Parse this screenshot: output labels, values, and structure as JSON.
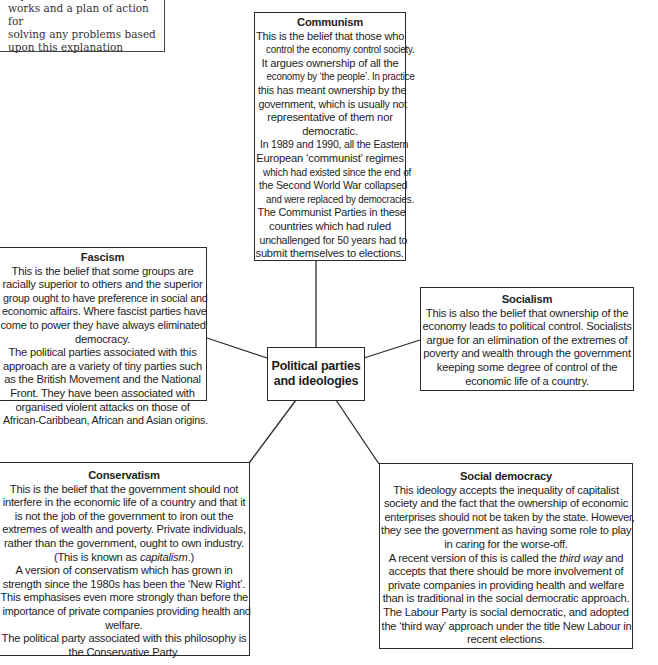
{
  "diagram": {
    "center": {
      "line1": "Political parties",
      "line2": "and ideologies"
    },
    "partial_box": {
      "lines": [
        "explanation of how society",
        "works and a plan of action for",
        "solving any problems based",
        "upon this explanation"
      ]
    },
    "communism": {
      "title": "Communism",
      "lines": [
        "This is the belief that those who",
        "control the economy control society.",
        "It argues ownership of all the",
        "economy by ‘the people’. In practice",
        "this has meant ownership by the",
        "government, which is usually not",
        "representative of them nor",
        "democratic.",
        "In 1989 and 1990, all the Eastern",
        "European ‘communist’ regimes",
        "which had existed since the end of",
        "the Second World War collapsed",
        "and were replaced by democracies.",
        "The Communist Parties in these",
        "countries which had ruled",
        "unchallenged for 50 years had to",
        "submit themselves to elections."
      ]
    },
    "fascism": {
      "title": "Fascism",
      "lines": [
        "This is the belief that some groups are",
        "racially superior to others and the superior",
        "group ought to have preference in social and",
        "economic affairs. Where fascist parties have",
        "come to power they have always eliminated",
        "democracy.",
        "The political parties associated with this",
        "approach are a variety of tiny parties such",
        "as the British Movement and the National",
        "Front. They have been associated with",
        "organised violent attacks on those of",
        "African-Caribbean, African and Asian origins."
      ]
    },
    "socialism": {
      "title": "Socialism",
      "lines": [
        "This is also the belief that ownership of the",
        "economy leads to political control. Socialists",
        "argue for an elimination of the extremes of",
        "poverty and wealth through the government",
        "keeping some degree of control of the",
        "economic life of a country."
      ]
    },
    "conservatism": {
      "title": "Conservatism",
      "lines": [
        "This is the belief that the government should not",
        "interfere in the economic life of a country and that it",
        "is not the job of the government to iron out the",
        "extremes of wealth and poverty. Private individuals,",
        "rather than the government, ought to own industry."
      ],
      "capitalism_prefix": "(This is known as ",
      "capitalism_term": "capitalism",
      "capitalism_suffix": ".)",
      "lines2": [
        "A version of conservatism which has grown in",
        "strength since the 1980s has been the ‘New Right’.",
        "This emphasises even more strongly than before the",
        "importance of private companies providing health and",
        "welfare.",
        "The political party associated with this philosophy is",
        "the Conservative Party."
      ]
    },
    "social_democracy": {
      "title": "Social democracy",
      "lines": [
        "This ideology accepts the inequality of capitalist",
        "society and the fact that the ownership of economic",
        "enterprises should not be taken by the state. However,",
        "they see the government as having some role to play",
        "in caring for the worse-off."
      ],
      "third_way_prefix": "A recent version of this is called the ",
      "third_way_term": "third way",
      "third_way_suffix": " and",
      "lines2": [
        "accepts that there should be more involvement of",
        "private companies in providing health and welfare",
        "than is traditional in the social democratic approach.",
        "The Labour Party is social democratic, and adopted",
        "the ‘third way’ approach under the title New Labour in",
        "recent elections."
      ]
    }
  }
}
